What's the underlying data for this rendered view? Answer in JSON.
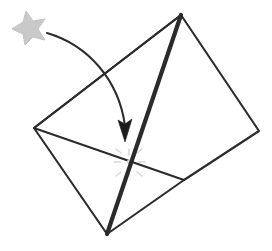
{
  "figure": {
    "background_color": "#ffffff",
    "line_color": "#2b2b2b",
    "thick_line_color": "#1d1d1d",
    "star_color": "#c9c9c9",
    "marker_color": "#dcdcdc",
    "caption": ""
  },
  "shape": {
    "name": "tilted-quadrilateral-sheet",
    "vertices": {
      "top": [
        181,
        15
      ],
      "right": [
        259,
        131
      ],
      "bottom_right": [
        184,
        180
      ],
      "bottom": [
        107,
        234
      ],
      "left": [
        34,
        128
      ]
    },
    "outline_points": "181,15 259,131 184,180 107,234 34,128",
    "fold_lines": [
      {
        "name": "fold-left-to-bottom-right",
        "style": "thin",
        "points": "34,128 184,180"
      },
      {
        "name": "fold-top-to-bottom-main-crease",
        "style": "thick",
        "points": "181,15 107,234"
      },
      {
        "name": "fold-top-to-left",
        "style": "thin",
        "points": "181,15 34,128"
      }
    ]
  },
  "annotations": {
    "star": {
      "name": "star-marker",
      "label": "",
      "position": [
        26,
        26
      ],
      "points": "26,11 33,21 45,19 38,29 45,40 33,37 25,45 23,34 12,29 23,22"
    },
    "arrow": {
      "name": "curved-action-arrow",
      "label": "",
      "curve_path": "M 47,33 C 88,45 119,80 125,126",
      "head_points": "125,142 118,120 125,124 132,119"
    },
    "target_point": {
      "name": "fold-target-point",
      "label": "",
      "position": [
        129,
        162
      ]
    }
  }
}
